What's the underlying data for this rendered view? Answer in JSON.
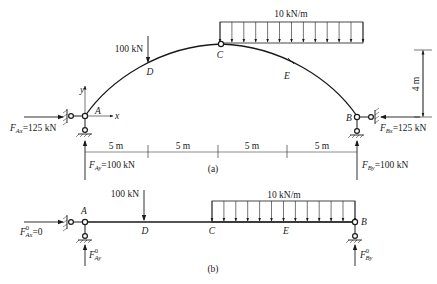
{
  "figure_a": {
    "caption": "(a)",
    "distributed_load": "10 kN/m",
    "point_load": "100 kN",
    "points": {
      "A": "A",
      "B": "B",
      "C": "C",
      "D": "D",
      "E": "E"
    },
    "axes": {
      "x": "x",
      "y": "y"
    },
    "rise_dimension": "4 m",
    "span_dimensions": [
      "5 m",
      "5 m",
      "5 m",
      "5 m"
    ],
    "reactions": {
      "FAx": {
        "symbol": "F",
        "sub": "Ax",
        "value": "=125 kN"
      },
      "FAy": {
        "symbol": "F",
        "sub": "Ay",
        "value": "=100 kN"
      },
      "FBx": {
        "symbol": "F",
        "sub": "Bx",
        "value": "=125 kN"
      },
      "FBy": {
        "symbol": "F",
        "sub": "By",
        "value": "=100 kN"
      }
    }
  },
  "figure_b": {
    "caption": "(b)",
    "distributed_load": "10 kN/m",
    "point_load": "100 kN",
    "points": {
      "A": "A",
      "B": "B",
      "C": "C",
      "D": "D",
      "E": "E"
    },
    "reactions": {
      "FAx0": {
        "symbol": "F",
        "sup": "0",
        "sub": "Ax",
        "value": "=0"
      },
      "FAy0": {
        "symbol": "F",
        "sup": "0",
        "sub": "Ay"
      },
      "FBy0": {
        "symbol": "F",
        "sup": "0",
        "sub": "By"
      }
    }
  },
  "colors": {
    "ink": "#1a1a1a",
    "background": "#ffffff"
  }
}
